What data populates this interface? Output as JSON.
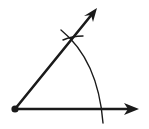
{
  "diagram": {
    "title": "",
    "type": "geometric-construction",
    "colors": {
      "stroke": "#1a1a1a",
      "background": "#ffffff"
    },
    "vertex": {
      "x": 15,
      "y": 109
    },
    "rays": [
      {
        "name": "horizontal-ray",
        "from": [
          15,
          109
        ],
        "to": [
          138,
          109
        ]
      },
      {
        "name": "diagonal-ray",
        "from": [
          15,
          109
        ],
        "to": [
          97,
          8
        ]
      }
    ],
    "arc": {
      "center": [
        15,
        109
      ],
      "radius": 87
    },
    "labels": []
  }
}
